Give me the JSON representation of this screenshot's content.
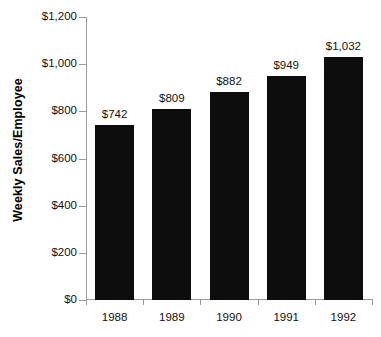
{
  "chart_data": {
    "type": "bar",
    "title": "",
    "xlabel": "",
    "ylabel": "Weekly Sales/Employee",
    "categories": [
      "1988",
      "1989",
      "1990",
      "1991",
      "1992"
    ],
    "values": [
      742,
      809,
      882,
      949,
      1032
    ],
    "value_labels": [
      "$742",
      "$809",
      "$882",
      "$949",
      "$1,032"
    ],
    "ylim": [
      0,
      1200
    ],
    "ytick_values": [
      0,
      200,
      400,
      600,
      800,
      1000,
      1200
    ],
    "ytick_labels": [
      "$0",
      "$200",
      "$400",
      "$600",
      "$800",
      "$1,000",
      "$1,200"
    ],
    "grid": false,
    "legend": "none",
    "bar_color": "#0d0d0d",
    "axis_color": "#9a9a9a",
    "text_color": "#111111",
    "background_color": "#ffffff"
  }
}
